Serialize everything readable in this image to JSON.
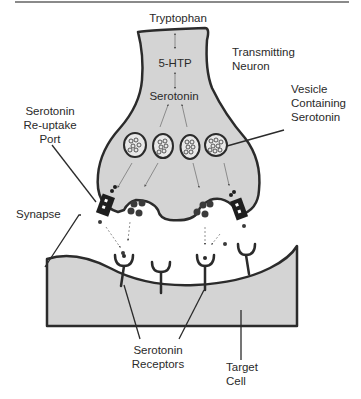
{
  "diagram": {
    "type": "biology-schematic",
    "colors": {
      "cell_fill": "#d4d4d4",
      "outline": "#2b2b2b",
      "text": "#2a2a2a",
      "arrow": "#555555",
      "top_rule": "#8a8a8a"
    },
    "labels": {
      "tryptophan": "Tryptophan",
      "five_htp": "5-HTP",
      "serotonin": "Serotonin",
      "transmitting_neuron": [
        "Transmitting",
        "Neuron"
      ],
      "vesicle": [
        "Vesicle",
        "Containing",
        "Serotonin"
      ],
      "reuptake_port": [
        "Serotonin",
        "Re-uptake",
        "Port"
      ],
      "synapse": "Synapse",
      "receptors": [
        "Serotonin",
        "Receptors"
      ],
      "target_cell": [
        "Target",
        "Cell"
      ]
    },
    "pathway": [
      "Tryptophan",
      "5-HTP",
      "Serotonin"
    ],
    "vesicle_count": 4,
    "receptor_count": 4,
    "reuptake_port_count": 2
  }
}
